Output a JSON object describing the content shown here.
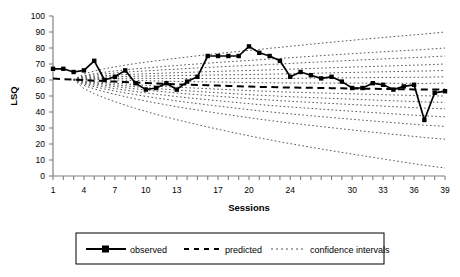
{
  "chart_data": {
    "type": "line",
    "title": "",
    "xlabel": "Sessions",
    "ylabel": "LSQ",
    "xlim": [
      1,
      39
    ],
    "ylim": [
      0,
      100
    ],
    "grid": false,
    "legend_position": "bottom",
    "y_ticks": [
      0,
      10,
      20,
      30,
      40,
      50,
      60,
      70,
      80,
      90,
      100
    ],
    "x_tick_labels": [
      "1",
      "4",
      "7",
      "10",
      "13",
      "17",
      "20",
      "24",
      "30",
      "33",
      "36",
      "39"
    ],
    "x_tick_values": [
      1,
      4,
      7,
      10,
      13,
      17,
      20,
      24,
      30,
      33,
      36,
      39
    ],
    "x": [
      1,
      2,
      3,
      4,
      5,
      6,
      7,
      8,
      9,
      10,
      11,
      12,
      13,
      14,
      15,
      16,
      17,
      18,
      19,
      20,
      21,
      22,
      23,
      24,
      25,
      26,
      27,
      28,
      29,
      30,
      31,
      32,
      33,
      34,
      35,
      36,
      37,
      38,
      39
    ],
    "series": [
      {
        "name": "observed",
        "style": "solid-with-square-markers",
        "values": [
          67,
          67,
          65,
          66,
          72,
          60,
          62,
          66,
          58,
          54,
          55,
          58,
          54,
          59,
          62,
          75,
          75,
          75,
          75,
          81,
          77,
          75,
          72,
          62,
          65,
          63,
          61,
          62,
          59,
          55,
          55,
          58,
          57,
          54,
          56,
          57,
          35,
          52,
          53
        ]
      },
      {
        "name": "predicted",
        "style": "dashed",
        "values": [
          61.0,
          60.5,
          60.2,
          59.9,
          59.6,
          59.3,
          59.0,
          58.7,
          58.4,
          58.1,
          57.8,
          57.6,
          57.3,
          57.1,
          56.9,
          56.7,
          56.5,
          56.3,
          56.1,
          55.9,
          55.7,
          55.6,
          55.4,
          55.3,
          55.2,
          55.1,
          55.0,
          54.9,
          54.8,
          54.7,
          54.6,
          54.5,
          54.4,
          54.3,
          54.2,
          54.1,
          54.0,
          54.0,
          54.0
        ]
      }
    ],
    "confidence_intervals": {
      "name": "confidence intervals",
      "style": "dotted",
      "description": "fan of dotted bands opening from session 3, widening toward session 39",
      "levels": [
        {
          "offset_fraction": 0.1,
          "upper_end": 58,
          "lower_end": 50
        },
        {
          "offset_fraction": 0.24,
          "upper_end": 62,
          "lower_end": 46
        },
        {
          "offset_fraction": 0.38,
          "upper_end": 66,
          "lower_end": 42
        },
        {
          "offset_fraction": 0.52,
          "upper_end": 70,
          "lower_end": 37
        },
        {
          "offset_fraction": 0.66,
          "upper_end": 75,
          "lower_end": 31
        },
        {
          "offset_fraction": 0.8,
          "upper_end": 80,
          "lower_end": 23
        },
        {
          "offset_fraction": 1.0,
          "upper_end": 90,
          "lower_end": 5
        }
      ],
      "start_session": 3,
      "end_session": 39
    },
    "legend_entries": [
      {
        "label": "observed",
        "style": "solid-with-square-markers"
      },
      {
        "label": "predicted",
        "style": "dashed"
      },
      {
        "label": "confidence intervals",
        "style": "dotted"
      }
    ],
    "colors": {
      "observed": "#000000",
      "predicted": "#000000",
      "confidence": "#555555",
      "axis": "#808080",
      "background": "#ffffff"
    }
  }
}
